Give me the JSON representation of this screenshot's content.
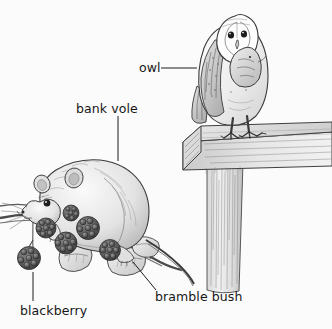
{
  "figure": {
    "background_color": "#fbfbfb",
    "ink_color": "#2b2b2b",
    "label_color": "#161616",
    "width": 332,
    "height": 329
  },
  "labels": {
    "owl": "owl",
    "bank_vole": "bank vole",
    "blackberry": "blackberry",
    "bramble_bush": "bramble bush"
  },
  "leader_lines": [
    {
      "name": "owl-leader",
      "from": [
        161,
        68
      ],
      "to": [
        197,
        68
      ],
      "style": "horizontal"
    },
    {
      "name": "bank-vole-leader",
      "from": [
        118,
        116
      ],
      "to": [
        118,
        161
      ],
      "style": "vertical"
    },
    {
      "name": "blackberry-leader",
      "from": [
        33,
        272
      ],
      "to": [
        33,
        301
      ],
      "style": "vertical"
    },
    {
      "name": "bramble-bush-leader",
      "from": [
        133,
        262
      ],
      "to": [
        156,
        290
      ],
      "style": "diagonal"
    }
  ],
  "subjects": [
    {
      "name": "owl",
      "description": "barn owl perched on wooden beam holding prey in talons"
    },
    {
      "name": "bank-vole",
      "description": "bank vole feeding on a bramble branch"
    },
    {
      "name": "blackberry",
      "description": "clusters of blackberry fruit on the bramble"
    },
    {
      "name": "bramble-bush",
      "description": "bramble branch with serrated leaves and thorns"
    },
    {
      "name": "fence-post",
      "description": "wooden fence beam on a vertical post"
    }
  ]
}
